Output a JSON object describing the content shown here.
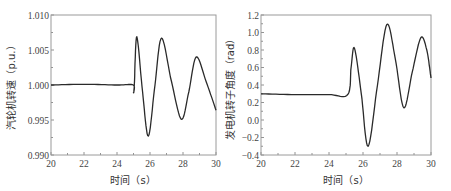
{
  "chart_data": [
    {
      "type": "line",
      "title": "",
      "xlabel": "时间（s）",
      "ylabel": "汽轮机转速（p.u.）",
      "xlim": [
        20,
        30
      ],
      "ylim": [
        0.99,
        1.01
      ],
      "xticks": [
        "20",
        "22",
        "24",
        "26",
        "28",
        "30"
      ],
      "yticks": [
        "0.990",
        "0.995",
        "1.000",
        "1.005",
        "1.010"
      ],
      "grid": false,
      "legend": null,
      "series": [
        {
          "name": "汽轮机转速",
          "color": "#2a2a2a",
          "x": [
            20.0,
            22.0,
            24.0,
            24.98,
            25.0,
            25.05,
            25.2,
            25.55,
            25.9,
            26.3,
            26.7,
            27.3,
            27.9,
            28.35,
            28.8,
            29.4,
            30.0
          ],
          "y": [
            1.0,
            1.0001,
            1.0,
            1.0,
            0.9989,
            1.0,
            1.0069,
            0.999,
            0.9927,
            1.0,
            1.0067,
            1.0005,
            0.9951,
            0.999,
            1.004,
            1.0005,
            0.9964
          ]
        }
      ]
    },
    {
      "type": "line",
      "title": "",
      "xlabel": "时间（s）",
      "ylabel": "发电机转子角度（rad）",
      "xlim": [
        20,
        30
      ],
      "ylim": [
        -0.4,
        1.2
      ],
      "xticks": [
        "20",
        "22",
        "24",
        "26",
        "28",
        "30"
      ],
      "yticks": [
        "-0.4",
        "-0.2",
        "0.0",
        "0.2",
        "0.4",
        "0.6",
        "0.8",
        "1.0",
        "1.2"
      ],
      "grid": false,
      "legend": null,
      "series": [
        {
          "name": "发电机转子角度",
          "color": "#2a2a2a",
          "x": [
            20.0,
            22.0,
            24.0,
            25.1,
            25.3,
            25.5,
            25.9,
            26.3,
            26.85,
            27.4,
            27.9,
            28.4,
            28.9,
            29.4,
            29.75,
            30.0
          ],
          "y": [
            0.3,
            0.29,
            0.29,
            0.29,
            0.6,
            0.82,
            0.3,
            -0.3,
            0.4,
            1.09,
            0.7,
            0.14,
            0.55,
            0.94,
            0.8,
            0.48
          ]
        }
      ]
    }
  ]
}
